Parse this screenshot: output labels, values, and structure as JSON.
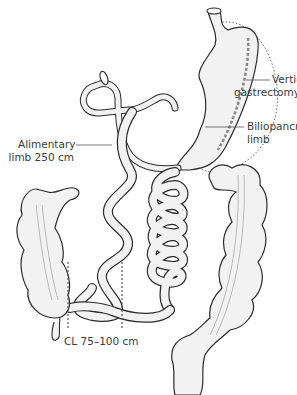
{
  "figure": {
    "labels": {
      "vertical_gastrectomy": [
        "Vertical",
        "gastrectomy"
      ],
      "biliopancreatic_limb": [
        "Biliopancreatic",
        "limb"
      ],
      "alimentary_limb": [
        "Alimentary",
        "limb 250 cm"
      ],
      "common_limb": "CL 75–100 cm"
    },
    "colors": {
      "outline": "#2b2b2b",
      "fill": "#f2f2f2",
      "shade": "#d8d8d8",
      "dotted": "#6a6a6a",
      "text": "#3a3a3a"
    }
  }
}
